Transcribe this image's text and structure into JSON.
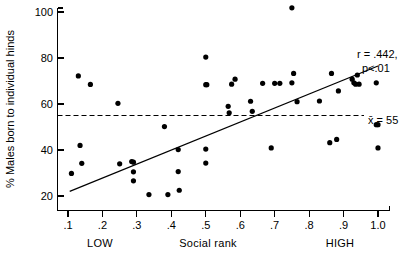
{
  "chart_data": {
    "type": "scatter",
    "title": "",
    "xlabel": "Social rank",
    "ylabel": "% Males born to individual hinds",
    "xlim": [
      0.05,
      1.03
    ],
    "ylim": [
      15,
      103
    ],
    "grid": false,
    "legend": "none",
    "x_ticks": [
      ".1",
      ".2",
      ".3",
      ".4",
      ".5",
      ".6",
      ".7",
      ".8",
      ".9",
      "1.0"
    ],
    "x_tick_values": [
      0.1,
      0.2,
      0.3,
      0.4,
      0.5,
      0.6,
      0.7,
      0.8,
      0.9,
      1.0
    ],
    "y_ticks": [
      "20",
      "40",
      "60",
      "80",
      "100"
    ],
    "y_tick_values": [
      20,
      40,
      60,
      80,
      100
    ],
    "x_range_labels": {
      "low": "LOW",
      "high": "HIGH"
    },
    "points": [
      [
        0.11,
        29.8
      ],
      [
        0.13,
        72.2
      ],
      [
        0.135,
        42.0
      ],
      [
        0.14,
        34.2
      ],
      [
        0.165,
        68.5
      ],
      [
        0.245,
        60.3
      ],
      [
        0.25,
        34.0
      ],
      [
        0.285,
        35.0
      ],
      [
        0.29,
        34.7
      ],
      [
        0.29,
        30.5
      ],
      [
        0.29,
        26.6
      ],
      [
        0.335,
        20.6
      ],
      [
        0.38,
        50.2
      ],
      [
        0.39,
        20.6
      ],
      [
        0.42,
        40.2
      ],
      [
        0.42,
        30.6
      ],
      [
        0.423,
        22.5
      ],
      [
        0.5,
        80.4
      ],
      [
        0.5,
        68.4
      ],
      [
        0.503,
        68.4
      ],
      [
        0.5,
        40.4
      ],
      [
        0.5,
        34.3
      ],
      [
        0.565,
        59.0
      ],
      [
        0.568,
        56.2
      ],
      [
        0.575,
        68.6
      ],
      [
        0.585,
        70.8
      ],
      [
        0.63,
        61.2
      ],
      [
        0.635,
        56.8
      ],
      [
        0.665,
        69.0
      ],
      [
        0.69,
        40.9
      ],
      [
        0.7,
        69.0
      ],
      [
        0.715,
        69.0
      ],
      [
        0.75,
        101.8
      ],
      [
        0.75,
        69.2
      ],
      [
        0.755,
        73.3
      ],
      [
        0.765,
        61.0
      ],
      [
        0.83,
        61.3
      ],
      [
        0.86,
        43.2
      ],
      [
        0.865,
        73.3
      ],
      [
        0.88,
        44.6
      ],
      [
        0.885,
        65.7
      ],
      [
        0.925,
        70.8
      ],
      [
        0.93,
        69.2
      ],
      [
        0.935,
        68.6
      ],
      [
        0.94,
        72.6
      ],
      [
        0.945,
        68.6
      ],
      [
        0.995,
        69.2
      ],
      [
        0.995,
        51.0
      ],
      [
        1.0,
        51.0
      ],
      [
        1.0,
        40.9
      ]
    ],
    "regression_line": {
      "x0": 0.105,
      "y0": 22.0,
      "x1": 1.0,
      "y1": 76.5,
      "r": ".442",
      "p": "p<.01"
    },
    "mean_line": {
      "value": 55,
      "label": "x̄ = 55"
    },
    "annotations": [
      "r = .442,",
      "p<.01",
      "x̄ = 55"
    ]
  },
  "axis": {
    "y_title": "% Males born to individual hinds",
    "x_title": "Social rank",
    "x_low": "LOW",
    "x_high": "HIGH"
  },
  "stats": {
    "r_label": "r = .442,",
    "p_label": "p<.01",
    "mean_label": "x̄ = 55"
  }
}
